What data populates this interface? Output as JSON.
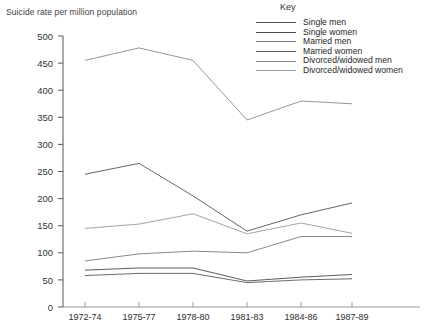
{
  "axis_title": "Suicide rate per million population",
  "key": {
    "title": "Key",
    "entries": [
      {
        "label": "Single men",
        "color": "#555555"
      },
      {
        "label": "Single women",
        "color": "#4a4a4a"
      },
      {
        "label": "Married men",
        "color": "#7a7a7a"
      },
      {
        "label": "Married women",
        "color": "#5a5a5a"
      },
      {
        "label": "Divorced/widowed men",
        "color": "#8a8a8a"
      },
      {
        "label": "Divorced/widowed women",
        "color": "#9a9a9a"
      }
    ]
  },
  "chart_data": {
    "type": "line",
    "title": "",
    "xlabel": "",
    "ylabel": "Suicide rate per million population",
    "categories": [
      "1972-74",
      "1975-77",
      "1978-80",
      "1981-83",
      "1984-86",
      "1987-89"
    ],
    "ylim": [
      0,
      500
    ],
    "yticks": [
      0,
      50,
      100,
      150,
      200,
      250,
      300,
      350,
      400,
      450,
      500
    ],
    "grid": false,
    "legend_position": "top-right",
    "series": [
      {
        "name": "Single men",
        "color": "#555555",
        "values": [
          245,
          265,
          205,
          140,
          170,
          192
        ]
      },
      {
        "name": "Single women",
        "color": "#4a4a4a",
        "values": [
          68,
          72,
          72,
          48,
          55,
          60
        ]
      },
      {
        "name": "Married men",
        "color": "#7a7a7a",
        "values": [
          85,
          98,
          103,
          100,
          130,
          130
        ]
      },
      {
        "name": "Married women",
        "color": "#5a5a5a",
        "values": [
          58,
          62,
          62,
          45,
          50,
          52
        ]
      },
      {
        "name": "Divorced/widowed men",
        "color": "#8a8a8a",
        "values": [
          455,
          478,
          455,
          345,
          380,
          375
        ]
      },
      {
        "name": "Divorced/widowed women",
        "color": "#9a9a9a",
        "values": [
          145,
          153,
          172,
          135,
          155,
          136
        ]
      }
    ]
  }
}
